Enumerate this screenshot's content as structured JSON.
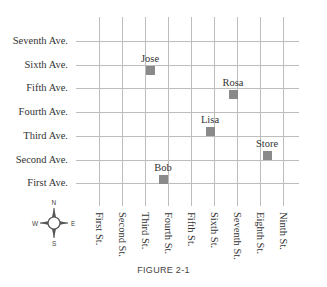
{
  "figure": {
    "caption": "FIGURE 2-1",
    "avenues": [
      {
        "label": "Seventh Ave.",
        "y": 41
      },
      {
        "label": "Sixth Ave.",
        "y": 65
      },
      {
        "label": "Fifth Ave.",
        "y": 88
      },
      {
        "label": "Fourth Ave.",
        "y": 112
      },
      {
        "label": "Third Ave.",
        "y": 136
      },
      {
        "label": "Second Ave.",
        "y": 160
      },
      {
        "label": "First Ave.",
        "y": 183
      }
    ],
    "streets": [
      {
        "label": "First St.",
        "x": 99
      },
      {
        "label": "Second St.",
        "x": 122
      },
      {
        "label": "Third St.",
        "x": 145
      },
      {
        "label": "Fourth St.",
        "x": 168
      },
      {
        "label": "Fifth St.",
        "x": 191
      },
      {
        "label": "Sixth St.",
        "x": 214
      },
      {
        "label": "Seventh St.",
        "x": 237
      },
      {
        "label": "Eighth St.",
        "x": 260
      },
      {
        "label": "Ninth St.",
        "x": 283
      }
    ],
    "locations": [
      {
        "name": "Jose",
        "x": 150,
        "y": 70
      },
      {
        "name": "Rosa",
        "x": 233,
        "y": 94
      },
      {
        "name": "Lisa",
        "x": 210,
        "y": 131
      },
      {
        "name": "Store",
        "x": 267,
        "y": 155
      },
      {
        "name": "Bob",
        "x": 163,
        "y": 179
      }
    ],
    "compass": {
      "north": "N",
      "south": "S",
      "east": "E",
      "west": "W"
    }
  },
  "colors": {
    "grid_line": "#bdbdbd",
    "marker": "#8a8a8a",
    "text": "#333333"
  }
}
